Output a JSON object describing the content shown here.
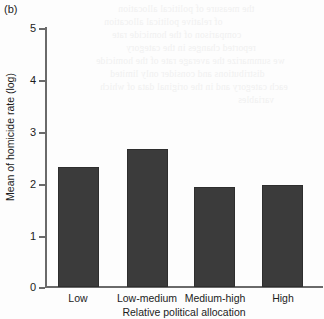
{
  "panel": {
    "label": "(b)"
  },
  "chart_data": {
    "type": "bar",
    "title": "",
    "subtitle": "",
    "categories": [
      "Low",
      "Low-medium",
      "Medium-high",
      "High"
    ],
    "values": [
      2.45,
      2.82,
      2.04,
      2.09
    ],
    "series": [
      {
        "name": "Mean of homicide rate (log)",
        "values": [
          2.45,
          2.82,
          2.04,
          2.09
        ]
      }
    ],
    "xlabel": "Relative political allocation",
    "ylabel": "Mean of homicide rate (log)",
    "ylim": [
      0,
      5.3
    ],
    "yticks": [
      0,
      1,
      2,
      3,
      4,
      5
    ],
    "ytick_labels": [
      "0",
      "1",
      "2",
      "3",
      "4",
      "5"
    ],
    "xlim": [
      0,
      4
    ],
    "grid": false,
    "legend": false,
    "legend_position": "none",
    "bar_color": "#3b3b3b",
    "axis_color": "#6a6a6a",
    "background_color": "#fdfdfd"
  },
  "ghost_text": [
    "the measure of political allocation",
    "of relative political allocation",
    "comparison of the homicide rate",
    "reported changes in the category",
    "we summarize the average rate of the homicide",
    "distributions and consider only limited",
    "each category and in the original data of which",
    "variables"
  ]
}
